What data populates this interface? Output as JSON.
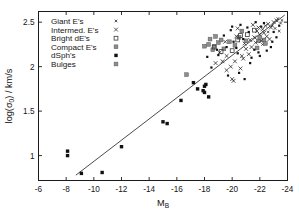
{
  "figure": {
    "kind": "scatter-plot",
    "background": "#ffffff",
    "frame_color": "#1a1a1a"
  },
  "chart_data": {
    "type": "scatter",
    "title": "",
    "xlabel": "M_B",
    "xlabel_base": "M",
    "xlabel_sub": "B",
    "ylabel": "log(σ₀) / km/s",
    "ylabel_prefix": "log(",
    "ylabel_sigma": "σ",
    "ylabel_sub": "0",
    "ylabel_suffix": ") / km/s",
    "xlim": [
      -6,
      -24
    ],
    "ylim": [
      0.72,
      2.62
    ],
    "x_inverted": true,
    "grid": false,
    "xticks": [
      -6,
      -8,
      -10,
      -12,
      -14,
      -16,
      -18,
      -20,
      -22,
      -24
    ],
    "xticklabels": [
      "-6",
      "-8",
      "-10",
      "-12",
      "-14",
      "-16",
      "-18",
      "-20",
      "-22",
      "-24"
    ],
    "yticks": [
      1,
      1.5,
      2,
      2.5
    ],
    "yticklabels": [
      "1",
      "1.5",
      "2",
      "2.5"
    ],
    "legend_position": "upper-left",
    "legend": [
      {
        "label": "Giant E's",
        "marker": "cross-small",
        "color": "#222222"
      },
      {
        "label": "Intermed. E's",
        "marker": "cross",
        "color": "#222222"
      },
      {
        "label": "Bright dE's",
        "marker": "square-open",
        "color": "#3a3a3a"
      },
      {
        "label": "Compact E's",
        "marker": "square-grey",
        "color": "#8d8d8d"
      },
      {
        "label": "dSph's",
        "marker": "square-fill",
        "color": "#111111"
      },
      {
        "label": "Bulges",
        "marker": "square-grey2",
        "color": "#8d8d8d"
      }
    ],
    "fit_line": {
      "x_start": -8.7,
      "y_start": 0.78,
      "x_end": -23.8,
      "y_end": 2.58,
      "slope": -0.119,
      "color": "#2b2b2b"
    },
    "series": [
      {
        "name": "dSph's",
        "marker": "square-fill",
        "points": [
          [
            -8.1,
            1.05
          ],
          [
            -8.1,
            1.0
          ],
          [
            -9.1,
            0.8
          ],
          [
            -10.6,
            0.81
          ],
          [
            -12.0,
            1.1
          ],
          [
            -15.0,
            1.38
          ],
          [
            -15.3,
            1.36
          ],
          [
            -16.3,
            1.62
          ],
          [
            -17.2,
            1.82
          ],
          [
            -17.5,
            1.75
          ],
          [
            -17.9,
            1.73
          ],
          [
            -18.0,
            1.71
          ],
          [
            -18.1,
            1.8
          ],
          [
            -18.3,
            1.66
          ],
          [
            -18.0,
            1.78
          ]
        ]
      },
      {
        "name": "Compact E's",
        "marker": "square-grey",
        "points": [
          [
            -16.7,
            1.91
          ],
          [
            -18.4,
            2.31
          ],
          [
            -18.7,
            2.23
          ],
          [
            -18.6,
            2.19
          ],
          [
            -18.0,
            2.23
          ],
          [
            -19.4,
            2.2
          ],
          [
            -20.5,
            2.33
          ],
          [
            -21.9,
            2.29
          ],
          [
            -22.3,
            2.3
          ],
          [
            -18.8,
            2.34
          ]
        ]
      },
      {
        "name": "Bright dE's",
        "marker": "square-open",
        "points": [
          [
            -18.7,
            2.22
          ],
          [
            -19.2,
            2.17
          ],
          [
            -20.0,
            2.18
          ],
          [
            -20.4,
            2.3
          ],
          [
            -21.1,
            2.36
          ],
          [
            -20.6,
            2.35
          ],
          [
            -21.6,
            2.41
          ]
        ]
      },
      {
        "name": "Intermed. E's",
        "marker": "cross",
        "points": [
          [
            -19.1,
            2.16
          ],
          [
            -19.6,
            2.12
          ],
          [
            -19.9,
            2.0
          ],
          [
            -19.6,
            1.96
          ],
          [
            -20.2,
            2.06
          ],
          [
            -20.0,
            1.86
          ],
          [
            -20.6,
            1.98
          ],
          [
            -20.1,
            1.84
          ],
          [
            -20.7,
            2.12
          ],
          [
            -21.0,
            2.2
          ],
          [
            -20.4,
            2.43
          ],
          [
            -20.9,
            2.26
          ],
          [
            -21.3,
            2.3
          ],
          [
            -21.4,
            2.22
          ],
          [
            -21.2,
            2.14
          ],
          [
            -21.6,
            2.33
          ],
          [
            -21.8,
            2.4
          ],
          [
            -21.9,
            2.44
          ],
          [
            -22.0,
            2.36
          ],
          [
            -22.2,
            2.42
          ],
          [
            -22.4,
            2.46
          ],
          [
            -22.1,
            2.29
          ],
          [
            -22.6,
            2.48
          ],
          [
            -22.8,
            2.44
          ],
          [
            -22.3,
            2.38
          ],
          [
            -21.7,
            2.27
          ],
          [
            -20.8,
            2.09
          ],
          [
            -19.3,
            2.06
          ],
          [
            -18.8,
            2.04
          ],
          [
            -19.5,
            2.28
          ],
          [
            -20.3,
            2.34
          ],
          [
            -21.5,
            2.47
          ],
          [
            -22.5,
            2.34
          ],
          [
            -23.0,
            2.5
          ],
          [
            -23.2,
            2.52
          ],
          [
            -22.7,
            2.31
          ]
        ]
      },
      {
        "name": "Giant E's",
        "marker": "cross-small",
        "points": [
          [
            -22.9,
            2.46
          ],
          [
            -23.1,
            2.43
          ],
          [
            -23.3,
            2.54
          ],
          [
            -23.5,
            2.49
          ],
          [
            -22.6,
            2.39
          ],
          [
            -23.4,
            2.4
          ],
          [
            -22.2,
            2.25
          ],
          [
            -23.6,
            2.52
          ]
        ]
      },
      {
        "name": "Bulges",
        "marker": "square-grey2",
        "points": [
          [
            -18.3,
            2.25
          ],
          [
            -19.0,
            2.27
          ],
          [
            -19.8,
            2.28
          ],
          [
            -20.2,
            2.24
          ],
          [
            -21.0,
            2.29
          ],
          [
            -21.8,
            2.21
          ],
          [
            -22.0,
            2.33
          ],
          [
            -20.7,
            2.4
          ],
          [
            -19.2,
            2.3
          ],
          [
            -22.4,
            2.26
          ]
        ]
      },
      {
        "name": "Scatter extra",
        "marker": "dot",
        "points": [
          [
            -18.5,
            1.99
          ],
          [
            -19.7,
            1.9
          ],
          [
            -20.9,
            1.86
          ],
          [
            -18.2,
            2.11
          ],
          [
            -21.3,
            2.04
          ],
          [
            -22.0,
            2.12
          ],
          [
            -20.5,
            1.93
          ],
          [
            -19.9,
            2.41
          ],
          [
            -21.1,
            2.44
          ],
          [
            -20.0,
            2.45
          ],
          [
            -22.8,
            2.22
          ],
          [
            -23.2,
            2.33
          ],
          [
            -21.4,
            2.1
          ],
          [
            -19.4,
            2.35
          ],
          [
            -20.6,
            2.47
          ],
          [
            -22.5,
            2.18
          ],
          [
            -21.7,
            2.5
          ],
          [
            -20.3,
            2.21
          ],
          [
            -19.0,
            2.13
          ],
          [
            -22.9,
            2.28
          ],
          [
            -18.9,
            2.19
          ],
          [
            -20.1,
            2.28
          ],
          [
            -21.9,
            2.16
          ],
          [
            -23.4,
            2.46
          ],
          [
            -20.8,
            2.31
          ],
          [
            -21.2,
            2.39
          ],
          [
            -22.3,
            2.49
          ],
          [
            -19.6,
            2.22
          ],
          [
            -23.0,
            2.39
          ],
          [
            -20.4,
            2.15
          ],
          [
            -21.6,
            2.19
          ],
          [
            -22.1,
            2.45
          ]
        ]
      }
    ]
  }
}
